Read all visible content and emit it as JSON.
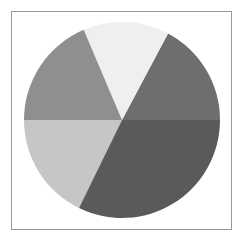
{
  "figure": {
    "background_color": "#ffffff",
    "frame": {
      "name": "plot-frame",
      "border_color": "#9a9a9a",
      "x": 11,
      "y": 11,
      "width": 221,
      "height": 219
    }
  },
  "chart_data": {
    "type": "pie",
    "title": "",
    "subtitle": "",
    "xlabel": "",
    "ylabel": "",
    "grid": false,
    "legend": "none",
    "labels_shown": false,
    "center": {
      "cx": 122,
      "cy": 120
    },
    "radius": 98,
    "start_angle_deg": 0,
    "direction": "counterclockwise",
    "categories": [
      "Slice 1",
      "Slice 2",
      "Slice 3",
      "Slice 4",
      "Slice 5"
    ],
    "values": [
      62,
      51,
      67,
      64,
      116
    ],
    "percentages": [
      17.2,
      14.2,
      18.6,
      17.8,
      32.2
    ],
    "angles_deg": [
      62,
      51,
      67,
      64,
      116
    ],
    "boundaries_deg": [
      0,
      62,
      113,
      180,
      244,
      360
    ],
    "colors": [
      "#6e6e6e",
      "#efefef",
      "#8f8f8f",
      "#c6c6c6",
      "#5a5a5a"
    ],
    "series": [
      {
        "name": "slices",
        "values": [
          62,
          51,
          67,
          64,
          116
        ]
      }
    ],
    "slices": [
      {
        "label": "Slice 1",
        "angle_deg": 62,
        "start_deg": 0,
        "end_deg": 62,
        "color": "#6e6e6e",
        "percent": 17.2
      },
      {
        "label": "Slice 2",
        "angle_deg": 51,
        "start_deg": 62,
        "end_deg": 113,
        "color": "#efefef",
        "percent": 14.2
      },
      {
        "label": "Slice 3",
        "angle_deg": 67,
        "start_deg": 113,
        "end_deg": 180,
        "color": "#8f8f8f",
        "percent": 18.6
      },
      {
        "label": "Slice 4",
        "angle_deg": 64,
        "start_deg": 180,
        "end_deg": 244,
        "color": "#c6c6c6",
        "percent": 17.8
      },
      {
        "label": "Slice 5",
        "angle_deg": 116,
        "start_deg": 244,
        "end_deg": 360,
        "color": "#5a5a5a",
        "percent": 32.2
      }
    ]
  }
}
